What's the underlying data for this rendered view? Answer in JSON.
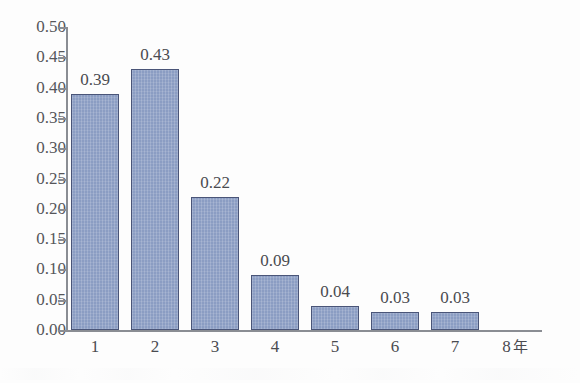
{
  "chart_data": {
    "type": "bar",
    "title": "",
    "subtitle": "",
    "xlabel": "",
    "ylabel": "",
    "categories": [
      "1",
      "2",
      "3",
      "4",
      "5",
      "6",
      "7",
      "8"
    ],
    "values": [
      0.39,
      0.43,
      0.22,
      0.09,
      0.04,
      0.03,
      0.03,
      null
    ],
    "bar_labels": [
      "0.39",
      "0.43",
      "0.22",
      "0.09",
      "0.04",
      "0.03",
      "0.03",
      ""
    ],
    "x_tick_labels": [
      "1",
      "2",
      "3",
      "4",
      "5",
      "6",
      "7",
      "8"
    ],
    "x_axis_unit": "年",
    "x_axis_end_label": "8 年",
    "ylim": [
      0.0,
      0.5
    ],
    "y_tick_step": 0.05,
    "y_tick_labels": [
      "0.50",
      "0.45",
      "0.40",
      "0.35",
      "0.30",
      "0.25",
      "0.20",
      "0.15",
      "0.10",
      "0.05",
      "0.00"
    ],
    "y_tick_values": [
      0.5,
      0.45,
      0.4,
      0.35,
      0.3,
      0.25,
      0.2,
      0.15,
      0.1,
      0.05,
      0.0
    ],
    "grid": false,
    "legend": null,
    "legend_position": "none",
    "annotations": [],
    "colors": {
      "bar_fill": "#8b9dc3",
      "bar_border": "#4a5578",
      "axis": "#8a8d93",
      "text": "#4a4b50",
      "tick_label": "#55565a",
      "background": "#fdfdfd"
    }
  }
}
